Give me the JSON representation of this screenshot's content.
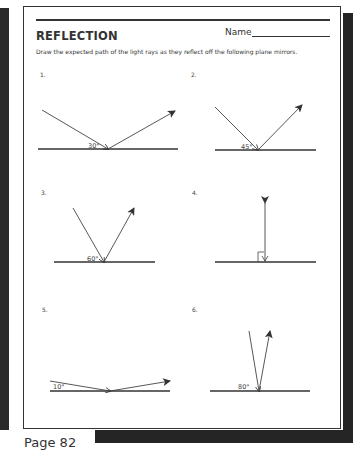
{
  "worksheet": {
    "title": "REFLECTION",
    "name_label": "Name",
    "instructions": "Draw the expected path of the light rays as they reflect off the following plane mirrors.",
    "page_label": "Page 82"
  },
  "problems": [
    {
      "number": "1.",
      "angle": "30°"
    },
    {
      "number": "2.",
      "angle": "45°"
    },
    {
      "number": "3.",
      "angle": "60°"
    },
    {
      "number": "4.",
      "angle": ""
    },
    {
      "number": "5.",
      "angle": "10°"
    },
    {
      "number": "6.",
      "angle": "80°"
    }
  ],
  "colors": {
    "ink": "#333333",
    "border_shadow": "#252525"
  }
}
